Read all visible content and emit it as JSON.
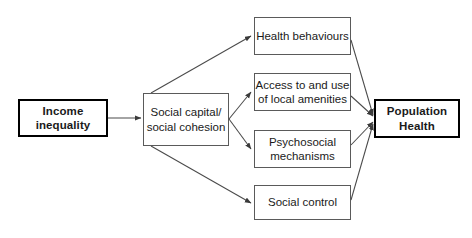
{
  "diagram": {
    "type": "flow-diagram",
    "background_color": "#ffffff",
    "line_color": "#4a4a4a",
    "emphasis_border_color": "#000000",
    "plain_border_color": "#5a5a5a",
    "text_color": "#1a1a1a",
    "nodes": [
      {
        "id": "income-inequality",
        "label": "Income\ninequality",
        "emphasis": true,
        "x": 18,
        "y": 99,
        "w": 90,
        "h": 38
      },
      {
        "id": "social-capital",
        "label": "Social capital/\nsocial cohesion",
        "emphasis": false,
        "x": 143,
        "y": 93,
        "w": 86,
        "h": 53
      },
      {
        "id": "health-behaviours",
        "label": "Health behaviours",
        "emphasis": false,
        "x": 254,
        "y": 17,
        "w": 97,
        "h": 38
      },
      {
        "id": "access-local-amenities",
        "label": "Access to and use\nof local amenities",
        "emphasis": false,
        "x": 254,
        "y": 73,
        "w": 97,
        "h": 38
      },
      {
        "id": "psychosocial-mechanisms",
        "label": "Psychosocial\nmechanisms",
        "emphasis": false,
        "x": 254,
        "y": 130,
        "w": 97,
        "h": 38
      },
      {
        "id": "social-control",
        "label": "Social control",
        "emphasis": false,
        "x": 254,
        "y": 185,
        "w": 97,
        "h": 35
      },
      {
        "id": "population-health",
        "label": "Population\nHealth",
        "emphasis": true,
        "x": 374,
        "y": 99,
        "w": 86,
        "h": 39
      }
    ],
    "edges": [
      {
        "id": "income-to-social-capital",
        "from": "income-inequality",
        "to": "social-capital"
      },
      {
        "id": "social-capital-to-health-behaviours",
        "from": "social-capital",
        "to": "health-behaviours"
      },
      {
        "id": "social-capital-to-access-local-amenities",
        "from": "social-capital",
        "to": "access-local-amenities"
      },
      {
        "id": "social-capital-to-psychosocial-mechanisms",
        "from": "social-capital",
        "to": "psychosocial-mechanisms"
      },
      {
        "id": "social-capital-to-social-control",
        "from": "social-capital",
        "to": "social-control"
      },
      {
        "id": "health-behaviours-to-population-health",
        "from": "health-behaviours",
        "to": "population-health"
      },
      {
        "id": "access-local-amenities-to-population-health",
        "from": "access-local-amenities",
        "to": "population-health"
      },
      {
        "id": "psychosocial-mechanisms-to-population-health",
        "from": "psychosocial-mechanisms",
        "to": "population-health"
      },
      {
        "id": "social-control-to-population-health",
        "from": "social-control",
        "to": "population-health"
      }
    ]
  }
}
